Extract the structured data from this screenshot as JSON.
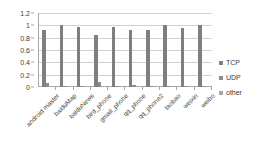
{
  "chart_data": {
    "type": "bar",
    "title": "",
    "xlabel": "",
    "ylabel": "",
    "ylim": [
      0,
      1.2
    ],
    "yticks": [
      "0",
      "0.2",
      "0.4",
      "0.6",
      "0.8",
      "1",
      "1.2"
    ],
    "ytick_values": [
      0,
      0.2,
      0.4,
      0.6,
      0.8,
      1,
      1.2
    ],
    "grid": true,
    "legend_position": "right",
    "categories": [
      "android master",
      "baiduMap",
      "baiduNews",
      "bird_phone",
      "gmail_phone",
      "qq_phone",
      "qq_phone2",
      "taobao",
      "weixin",
      "weibo"
    ],
    "series": [
      {
        "name": "TCP",
        "color": "#7f7f7f",
        "values": [
          0.92,
          1.0,
          0.98,
          0.84,
          0.98,
          0.93,
          0.93,
          1.0,
          0.95,
          1.0
        ]
      },
      {
        "name": "UDP",
        "color": "#8c8c8c",
        "values": [
          0.07,
          0.02,
          0.02,
          0.08,
          0.01,
          0.03,
          0.02,
          0.01,
          0.02,
          0.01
        ]
      },
      {
        "name": "other",
        "color": "#a6a6a6",
        "values": [
          0.0,
          0.0,
          0.0,
          0.0,
          0.0,
          0.0,
          0.0,
          0.0,
          0.0,
          0.0
        ]
      }
    ]
  },
  "legend": {
    "items": [
      {
        "label": "TCP",
        "color": "#7f7f7f"
      },
      {
        "label": "UDP",
        "color": "#8c8c8c"
      },
      {
        "label": "other",
        "color": "#a6a6a6"
      }
    ]
  },
  "colors": {
    "plot_background": "#ffffff",
    "gridline": "#d2d2d2",
    "axis": "#a8a8a8",
    "text": "#3c3c3c"
  }
}
